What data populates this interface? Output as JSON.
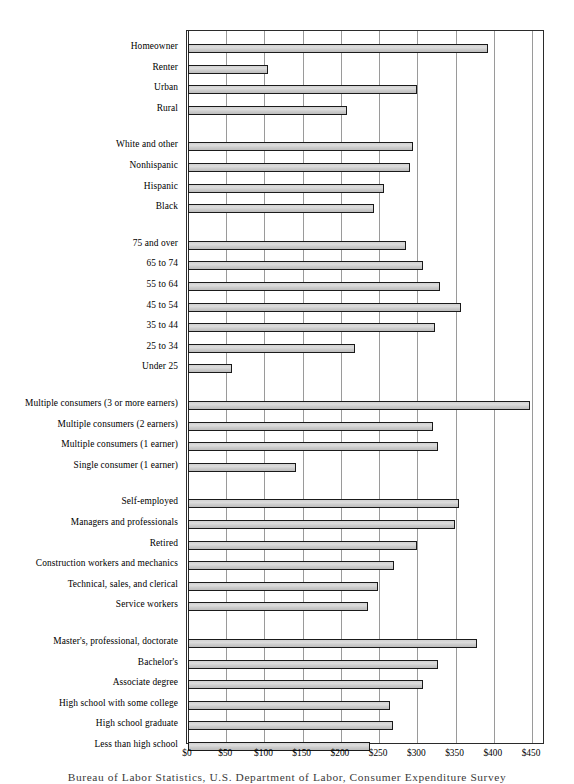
{
  "caption": "Bureau of Labor Statistics, U.S. Department of Labor, Consumer Expenditure Survey",
  "axis": {
    "tick_labels": [
      "$0",
      "$50",
      "$100",
      "$150",
      "$200",
      "$250",
      "$300",
      "$350",
      "$400",
      "$450"
    ]
  },
  "chart_data": {
    "type": "bar",
    "orientation": "horizontal",
    "title": "",
    "subtitle": "",
    "xlabel": "",
    "ylabel": "",
    "xlim": [
      0,
      450
    ],
    "xticks": [
      0,
      50,
      100,
      150,
      200,
      250,
      300,
      350,
      400,
      450
    ],
    "xtick_labels": [
      "$0",
      "$50",
      "$100",
      "$150",
      "$200",
      "$250",
      "$300",
      "$350",
      "$400",
      "$450"
    ],
    "grid": "vertical",
    "legend": "none",
    "bar_color": "#d5d5d5",
    "bar_edge_color": "#1a1a1a",
    "source_note": "Bureau of Labor Statistics, U.S. Department of Labor, Consumer Expenditure Survey",
    "groups": [
      {
        "name": "housing-tenure-and-location",
        "categories": [
          "Homeowner",
          "Renter",
          "Urban",
          "Rural"
        ],
        "values": [
          392,
          105,
          300,
          208
        ]
      },
      {
        "name": "race-and-ethnicity",
        "categories": [
          "White and other",
          "Nonhispanic",
          "Hispanic",
          "Black"
        ],
        "values": [
          294,
          290,
          257,
          243
        ]
      },
      {
        "name": "age-of-reference-person",
        "categories": [
          "75 and over",
          "65 to 74",
          "55 to 64",
          "45 to 54",
          "35 to 44",
          "25 to 34",
          "Under 25"
        ],
        "values": [
          285,
          308,
          330,
          357,
          323,
          219,
          57
        ]
      },
      {
        "name": "consumer-unit-composition",
        "categories": [
          "Multiple consumers (3 or more earners)",
          "Multiple consumers (2 earners)",
          "Multiple consumers (1 earner)",
          "Single consumer (1 earner)"
        ],
        "values": [
          447,
          320,
          327,
          141
        ]
      },
      {
        "name": "occupation",
        "categories": [
          "Self-employed",
          "Managers and professionals",
          "Retired",
          "Construction workers and mechanics",
          "Technical, sales, and clerical",
          "Service workers"
        ],
        "values": [
          354,
          349,
          300,
          270,
          249,
          235
        ]
      },
      {
        "name": "education",
        "categories": [
          "Master's, professional, doctorate",
          "Bachelor's",
          "Associate degree",
          "High school with some college",
          "High school graduate",
          "Less than high school"
        ],
        "values": [
          378,
          327,
          308,
          264,
          268,
          238
        ]
      }
    ]
  }
}
